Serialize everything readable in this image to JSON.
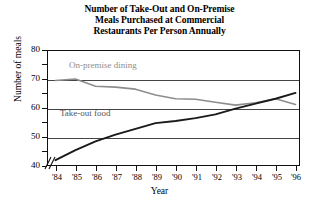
{
  "chart_data": {
    "type": "line",
    "title": "Number of Take-Out and On-Premise Meals Purchased at Commercial Restaurants Per Person Annually",
    "title_lines": [
      "Number of Take-Out and On-Premise",
      "Meals Purchased at Commercial",
      "Restaurants Per Person Annually"
    ],
    "xlabel": "Year",
    "ylabel": "Number of meals",
    "x": [
      "'84",
      "'85",
      "'86",
      "'87",
      "'88",
      "'89",
      "'90",
      "'91",
      "'92",
      "'93",
      "'94",
      "'95",
      "'96"
    ],
    "xtick_labels": [
      "'84",
      "'85",
      "'86",
      "'87",
      "'88",
      "'89",
      "'90",
      "'91",
      "'92",
      "'93",
      "'94",
      "'95",
      "'96"
    ],
    "ytick_labels": [
      "40",
      "50",
      "60",
      "70",
      "80"
    ],
    "ylim": [
      40,
      80
    ],
    "ytick_values": [
      40,
      50,
      60,
      70,
      80
    ],
    "grid": true,
    "grid_axis": "y",
    "legend": "inline-labels",
    "axis_break": true,
    "axis_break_note": "y-axis broken below 40",
    "series": [
      {
        "name": "On-premise dining",
        "color": "#8d8d8d",
        "values": [
          69.5,
          70.0,
          67.5,
          67.2,
          66.5,
          64.5,
          63.2,
          63.0,
          62.0,
          61.0,
          61.8,
          63.2,
          61.2
        ]
      },
      {
        "name": "Take-out food",
        "color": "#1a1a1a",
        "values": [
          42.0,
          45.5,
          48.5,
          50.8,
          52.8,
          54.8,
          55.5,
          56.5,
          57.8,
          59.8,
          61.5,
          63.2,
          65.2
        ]
      }
    ]
  },
  "series_labels": {
    "on_premise": "On-premise dining",
    "take_out": "Take-out food"
  }
}
